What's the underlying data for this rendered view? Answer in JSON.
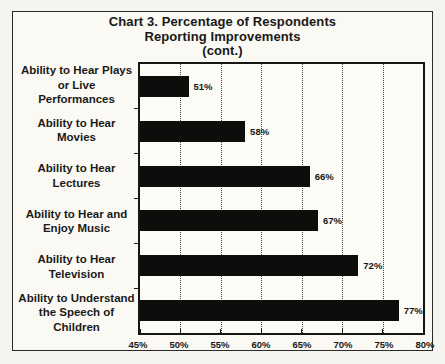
{
  "chart_data": {
    "type": "bar",
    "orientation": "horizontal",
    "title": "Chart 3. Percentage of Respondents Reporting Improvements (cont.)",
    "title_lines": [
      "Chart 3. Percentage of Respondents",
      "Reporting Improvements",
      "(cont.)"
    ],
    "categories": [
      "Ability to Hear Plays\nor Live Performances",
      "Ability to Hear\nMovies",
      "Ability to Hear\nLectures",
      "Ability to Hear and\nEnjoy Music",
      "Ability to Hear\nTelevision",
      "Ability to Understand\nthe Speech of Children"
    ],
    "values": [
      51,
      58,
      66,
      67,
      72,
      77
    ],
    "value_labels": [
      "51%",
      "58%",
      "66%",
      "67%",
      "72%",
      "77%"
    ],
    "xlabel": "",
    "ylabel": "",
    "xlim": [
      45,
      80
    ],
    "xtick_values": [
      45,
      50,
      55,
      60,
      65,
      70,
      75,
      80
    ],
    "xtick_labels": [
      "45%",
      "50%",
      "55%",
      "60%",
      "65%",
      "70%",
      "75%",
      "80%"
    ],
    "grid": {
      "vertical_dotted_at": [
        50,
        55,
        60,
        65,
        70,
        75
      ]
    },
    "legend": "none",
    "colors": {
      "bar": "#0d0d0b",
      "frame": "#161614",
      "background": "#f6f4ee",
      "text": "#1a1a18"
    }
  }
}
